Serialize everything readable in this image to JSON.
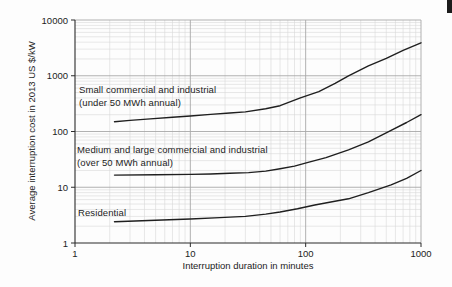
{
  "figure": {
    "page_marker_color": "#1c1c1c",
    "background": "#fdfdfd"
  },
  "chart_data": {
    "type": "line",
    "title": "",
    "x_axis": {
      "label": "Interruption duration in minutes",
      "scale": "log",
      "min": 1,
      "max": 1000,
      "ticks": [
        "1",
        "10",
        "100",
        "1000"
      ]
    },
    "y_axis": {
      "label": "Average interruption cost in 2013 US $/kW",
      "scale": "log",
      "min": 1,
      "max": 10000,
      "ticks": [
        "1",
        "10",
        "100",
        "1000",
        "10000"
      ]
    },
    "grid": {
      "major": true,
      "minor": true,
      "major_color": "#a8a8a8",
      "minor_color": "#d9d9d9"
    },
    "axis_color": "#2b2b2b",
    "line_color": "#1f1f1f",
    "series": [
      {
        "key": "small-commercial-industrial",
        "label_line1": "Small commercial and industrial",
        "label_line2": "(under 50 MWh annual)",
        "points": [
          [
            2.2,
            150
          ],
          [
            3,
            158
          ],
          [
            4.5,
            168
          ],
          [
            7,
            180
          ],
          [
            10,
            190
          ],
          [
            15,
            203
          ],
          [
            22,
            215
          ],
          [
            30,
            225
          ],
          [
            45,
            255
          ],
          [
            60,
            290
          ],
          [
            90,
            400
          ],
          [
            130,
            520
          ],
          [
            180,
            730
          ],
          [
            235,
            1000
          ],
          [
            350,
            1500
          ],
          [
            500,
            2050
          ],
          [
            700,
            2850
          ],
          [
            1000,
            3900
          ]
        ]
      },
      {
        "key": "medium-large-commercial-industrial",
        "label_line1": "Medium and large commercial and industrial",
        "label_line2": "(over 50 MWh annual)",
        "points": [
          [
            2.2,
            16.5
          ],
          [
            5,
            16.8
          ],
          [
            10,
            17
          ],
          [
            15,
            17.3
          ],
          [
            22,
            17.8
          ],
          [
            32,
            18.3
          ],
          [
            45,
            19.5
          ],
          [
            60,
            21.5
          ],
          [
            80,
            24
          ],
          [
            105,
            28
          ],
          [
            150,
            34
          ],
          [
            235,
            47
          ],
          [
            350,
            65
          ],
          [
            550,
            105
          ],
          [
            750,
            145
          ],
          [
            1000,
            200
          ]
        ]
      },
      {
        "key": "residential",
        "label_line1": "Residential",
        "label_line2": "",
        "points": [
          [
            2.2,
            2.4
          ],
          [
            5,
            2.55
          ],
          [
            10,
            2.7
          ],
          [
            18,
            2.85
          ],
          [
            30,
            3.0
          ],
          [
            45,
            3.3
          ],
          [
            60,
            3.6
          ],
          [
            85,
            4.1
          ],
          [
            120,
            4.8
          ],
          [
            170,
            5.5
          ],
          [
            235,
            6.2
          ],
          [
            350,
            8
          ],
          [
            550,
            11
          ],
          [
            750,
            14.5
          ],
          [
            1000,
            20
          ]
        ]
      }
    ]
  }
}
